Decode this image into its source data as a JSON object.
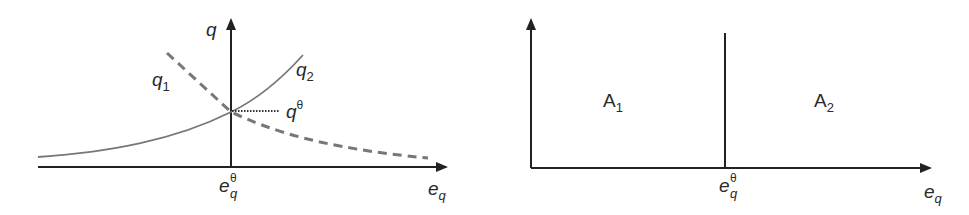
{
  "left_diagram": {
    "y_axis_label": "q",
    "x_axis_label": "e",
    "x_axis_label_sub": "q",
    "curve1_label": "q",
    "curve1_label_sub": "1",
    "curve1_style": "dashed",
    "curve2_label": "q",
    "curve2_label_sub": "2",
    "curve2_style": "solid",
    "equilibrium_q_label": "q",
    "equilibrium_q_sup": "θ",
    "equilibrium_e_label": "e",
    "equilibrium_e_sub": "q",
    "equilibrium_e_sup": "θ"
  },
  "right_diagram": {
    "x_axis_label": "e",
    "x_axis_label_sub": "q",
    "region1_label": "A",
    "region1_sub": "1",
    "region2_label": "A",
    "region2_sub": "2",
    "divider_label": "e",
    "divider_sub": "q",
    "divider_sup": "θ"
  },
  "colors": {
    "axis": "#222222",
    "curve": "#777777",
    "text": "#2a2a2a"
  }
}
